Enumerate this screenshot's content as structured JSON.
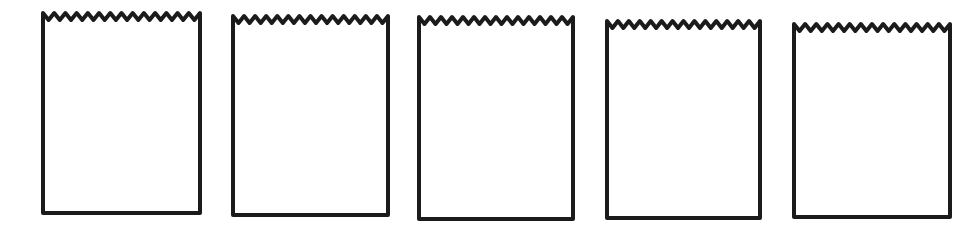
{
  "page": {
    "background_color": "#ffffff",
    "ink_color": "#1b1b1b"
  },
  "figures": {
    "type": "line-drawing",
    "count": 5,
    "items": [
      {
        "id": "bag-1"
      },
      {
        "id": "bag-2"
      },
      {
        "id": "bag-3"
      },
      {
        "id": "bag-4"
      },
      {
        "id": "bag-5"
      }
    ]
  }
}
